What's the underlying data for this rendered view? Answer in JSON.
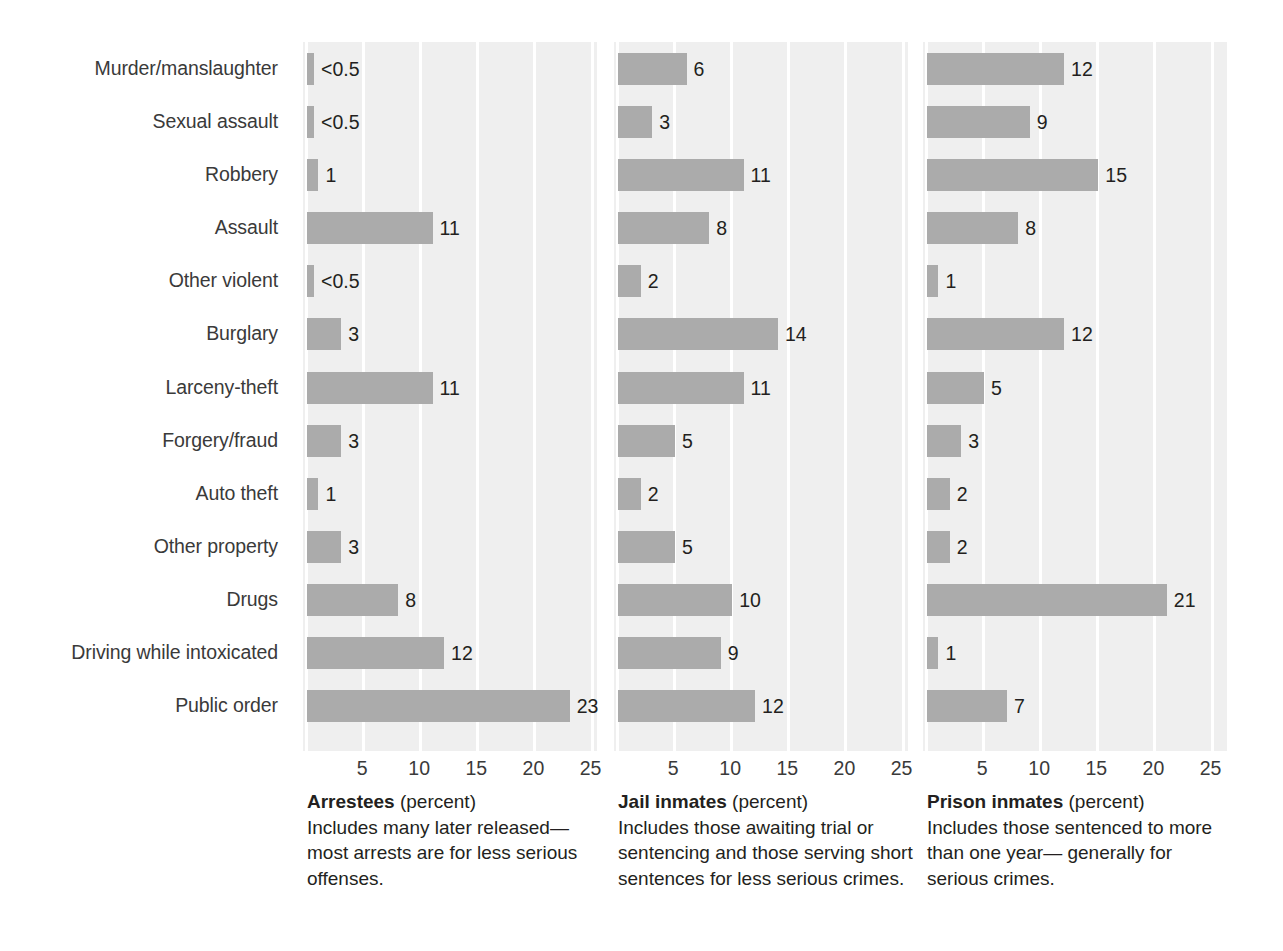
{
  "chart_data": {
    "type": "bar",
    "title": "",
    "orientation": "horizontal",
    "grid": true,
    "legend_position": "none",
    "xlabel": "percent",
    "ylabel": "",
    "xlim": [
      0,
      26
    ],
    "xticks": [
      5,
      10,
      15,
      20,
      25
    ],
    "xtick_labels": [
      "5",
      "10",
      "15",
      "20",
      "25"
    ],
    "categories": [
      "Murder/manslaughter",
      "Sexual assault",
      "Robbery",
      "Assault",
      "Other violent",
      "Burglary",
      "Larceny-theft",
      "Forgery/fraud",
      "Auto theft",
      "Other property",
      "Drugs",
      "Driving while intoxicated",
      "Public order"
    ],
    "series": [
      {
        "name": "Arrestees",
        "values": [
          0.3,
          0.3,
          1,
          11,
          0.3,
          3,
          11,
          3,
          1,
          3,
          8,
          12,
          23
        ],
        "labels": [
          "<0.5",
          "<0.5",
          "1",
          "11",
          "<0.5",
          "3",
          "11",
          "3",
          "1",
          "3",
          "8",
          "12",
          "23"
        ]
      },
      {
        "name": "Jail inmates",
        "values": [
          6,
          3,
          11,
          8,
          2,
          14,
          11,
          5,
          2,
          5,
          10,
          9,
          12
        ],
        "labels": [
          "6",
          "3",
          "11",
          "8",
          "2",
          "14",
          "11",
          "5",
          "2",
          "5",
          "10",
          "9",
          "12"
        ]
      },
      {
        "name": "Prison inmates",
        "values": [
          12,
          9,
          15,
          8,
          1,
          12,
          5,
          3,
          2,
          2,
          21,
          1,
          7
        ],
        "labels": [
          "12",
          "9",
          "15",
          "8",
          "1",
          "12",
          "5",
          "3",
          "2",
          "2",
          "21",
          "1",
          "7"
        ]
      }
    ],
    "panel_captions": [
      {
        "title": "Arrestees",
        "unit": "(percent)",
        "body": "Includes many later released—most arrests are for less serious offenses."
      },
      {
        "title": "Jail inmates",
        "unit": "(percent)",
        "body": "Includes those awaiting trial or sentencing and those serving short sentences for less serious crimes."
      },
      {
        "title": "Prison inmates",
        "unit": "(percent)",
        "body": "Includes those sentenced to more than one year— generally for serious crimes."
      }
    ],
    "colors": {
      "bar": "#ababab",
      "plot_background": "#efefef",
      "gridline": "#ffffff",
      "text": "#231f20",
      "page_background": "#ffffff"
    }
  }
}
